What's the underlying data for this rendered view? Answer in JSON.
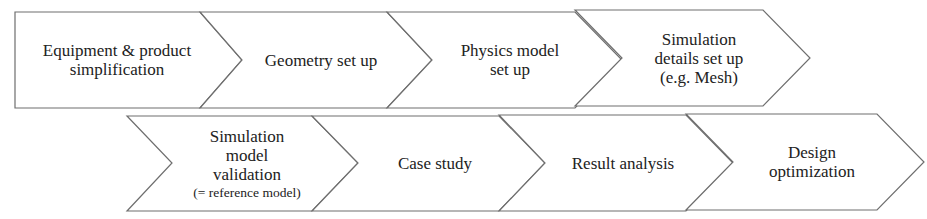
{
  "diagram": {
    "type": "process-chevron-flow",
    "colors": {
      "stroke": "#6e6e6e",
      "fill": "#ffffff",
      "text": "#222222"
    },
    "rows": [
      {
        "steps": [
          {
            "id": "step-1",
            "lines": [
              "Equipment & product",
              "simplification"
            ]
          },
          {
            "id": "step-2",
            "lines": [
              "Geometry set up"
            ]
          },
          {
            "id": "step-3",
            "lines": [
              "Physics model",
              "set up"
            ]
          },
          {
            "id": "step-4",
            "lines": [
              "Simulation",
              "details set up",
              "(e.g. Mesh)"
            ]
          }
        ]
      },
      {
        "steps": [
          {
            "id": "step-5",
            "lines": [
              "Simulation",
              "model",
              "validation",
              "(= reference model)"
            ]
          },
          {
            "id": "step-6",
            "lines": [
              "Case study"
            ]
          },
          {
            "id": "step-7",
            "lines": [
              "Result analysis"
            ]
          },
          {
            "id": "step-8",
            "lines": [
              "Design",
              "optimization"
            ]
          }
        ]
      }
    ]
  }
}
